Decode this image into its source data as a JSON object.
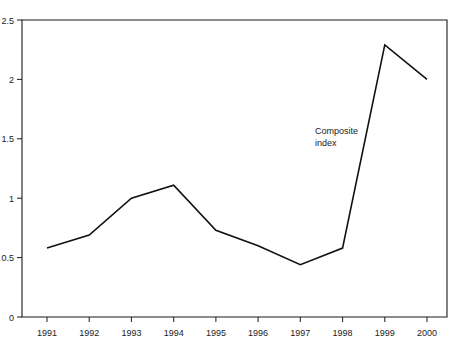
{
  "chart_data": {
    "type": "line",
    "title": "",
    "xlabel": "",
    "ylabel": "",
    "categories": [
      "1991",
      "1992",
      "1993",
      "1994",
      "1995",
      "1996",
      "1997",
      "1998",
      "1999",
      "2000"
    ],
    "series": [
      {
        "name": "Composite index",
        "values": [
          0.58,
          0.69,
          1.0,
          1.11,
          0.73,
          0.6,
          0.44,
          0.58,
          2.29,
          2.0
        ]
      }
    ],
    "ylim": [
      0,
      2.5
    ],
    "yticks": [
      0,
      0.5,
      1,
      1.5,
      2,
      2.5
    ],
    "ytick_labels": [
      "0",
      "0.5",
      "1",
      "1.5",
      "2",
      "2.5"
    ],
    "xtick_labels": [
      "1991",
      "1992",
      "1993",
      "1994",
      "1995",
      "1996",
      "1997",
      "1998",
      "1999",
      "2000"
    ],
    "grid": false,
    "legend": "none",
    "annotations": [
      {
        "text_line1": "Composite",
        "text_line2": "index",
        "x": "1998",
        "y": 1.55
      }
    ],
    "colors": {
      "line": "#111111",
      "axis": "#1a1a1a",
      "background": "#ffffff",
      "text": "#222222"
    }
  }
}
